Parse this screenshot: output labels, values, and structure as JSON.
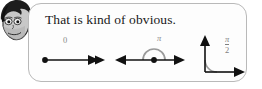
{
  "avatar": {
    "icon": "cartoon-face-avatar",
    "description": "grayscale cartoon boy head with dark hair"
  },
  "bubble": {
    "text": "That is kind of obvious.",
    "border_color": "#b9b9b9",
    "background_color": "#fdfdfd"
  },
  "figures": [
    {
      "name": "angle-zero",
      "label": "0",
      "description": "zero angle: two coincident rays pointing right from a vertex dot"
    },
    {
      "name": "angle-pi",
      "label": "π",
      "description": "straight angle: rays pointing left and right from a vertex dot with a semicircular arc"
    },
    {
      "name": "angle-pi-over-two",
      "numerator": "π",
      "denominator": "2",
      "description": "right angle: ray pointing up and ray pointing right with a quarter arc"
    }
  ],
  "colors": {
    "ink": "#111111",
    "arc": "#9a9a9a",
    "label": "#8a8a8a",
    "page_background": "#ffffff"
  }
}
